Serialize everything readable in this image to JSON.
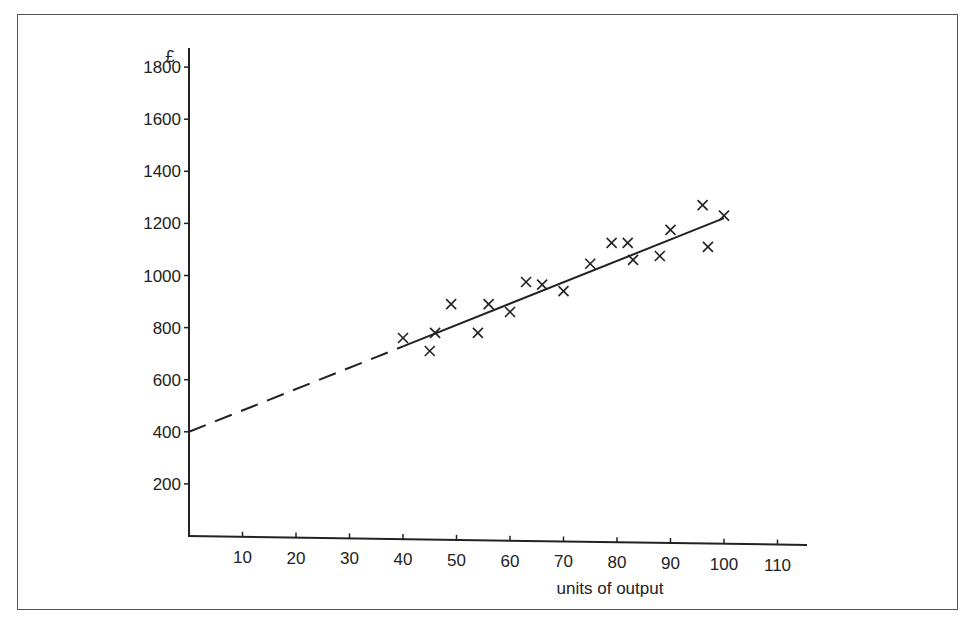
{
  "chart_data": {
    "type": "scatter",
    "title": "",
    "xlabel": "units of output",
    "ylabel": "£",
    "xlim": [
      0,
      115
    ],
    "ylim": [
      0,
      1850
    ],
    "x_ticks": [
      10,
      20,
      30,
      40,
      50,
      60,
      70,
      80,
      90,
      100,
      110
    ],
    "y_ticks": [
      200,
      400,
      600,
      800,
      1000,
      1200,
      1400,
      1600,
      1800
    ],
    "grid": false,
    "legend": null,
    "series": [
      {
        "name": "observations",
        "marker": "x",
        "points": [
          [
            40,
            760
          ],
          [
            45,
            710
          ],
          [
            46,
            780
          ],
          [
            49,
            890
          ],
          [
            54,
            780
          ],
          [
            56,
            890
          ],
          [
            60,
            860
          ],
          [
            63,
            975
          ],
          [
            66,
            965
          ],
          [
            70,
            940
          ],
          [
            75,
            1045
          ],
          [
            79,
            1125
          ],
          [
            82,
            1125
          ],
          [
            83,
            1060
          ],
          [
            88,
            1075
          ],
          [
            90,
            1175
          ],
          [
            96,
            1270
          ],
          [
            97,
            1110
          ],
          [
            100,
            1230
          ]
        ]
      }
    ],
    "fit_line": {
      "name": "line of best fit",
      "intercept": 400,
      "end": [
        100,
        1220
      ],
      "dashed_range": [
        0,
        40
      ],
      "solid_range": [
        40,
        100
      ]
    }
  },
  "axes": {
    "x_title": "units of output",
    "y_title": "£"
  }
}
